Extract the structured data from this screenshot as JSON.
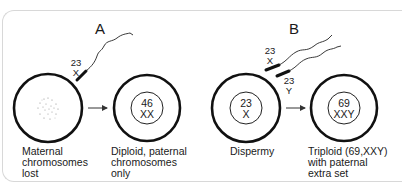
{
  "panels": [
    {
      "letter": "A",
      "sperm": [
        {
          "count": "23",
          "sex": "X"
        }
      ],
      "egg": {
        "state": "Maternal chromosomes lost",
        "caption": "Maternal\nchromosomes\nlost"
      },
      "result": {
        "count": "46",
        "karyotype": "XX",
        "caption": "Diploid, paternal\nchromosomes\nonly"
      }
    },
    {
      "letter": "B",
      "sperm": [
        {
          "count": "23",
          "sex": "X"
        },
        {
          "count": "23",
          "sex": "Y"
        }
      ],
      "egg": {
        "count": "23",
        "sex": "X",
        "caption": "Dispermy"
      },
      "result": {
        "count": "69",
        "karyotype": "XXY",
        "caption": "Triploid (69,XXY)\nwith paternal\nextra set"
      }
    }
  ],
  "colors": {
    "stroke": "#111111",
    "frame": "#d8d8d8",
    "dots": "#888888"
  }
}
